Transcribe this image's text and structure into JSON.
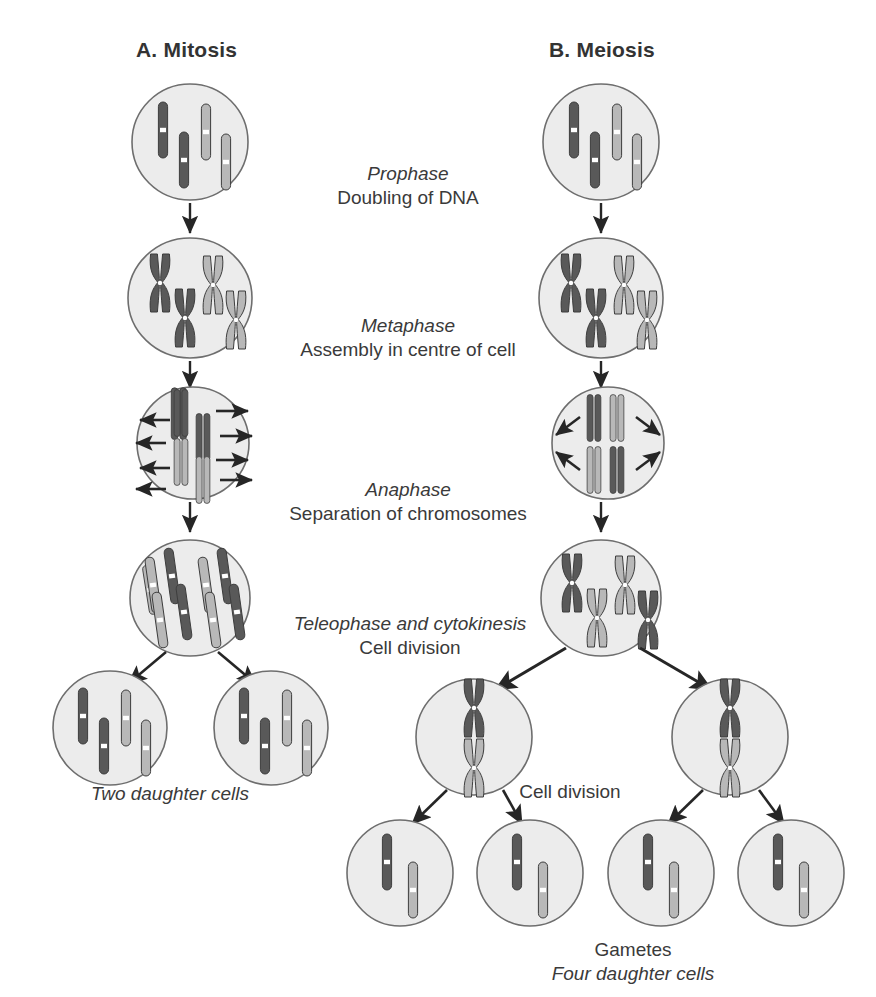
{
  "figure": {
    "columns": [
      {
        "id": "mitosis",
        "title": "A. Mitosis"
      },
      {
        "id": "meiosis",
        "title": "B. Meiosis"
      }
    ],
    "phases": [
      {
        "id": "prophase",
        "name": "Prophase",
        "description": "Doubling of DNA"
      },
      {
        "id": "metaphase",
        "name": "Metaphase",
        "description": "Assembly in centre of cell"
      },
      {
        "id": "anaphase",
        "name": "Anaphase",
        "description": "Separation of chromosomes"
      },
      {
        "id": "telophase",
        "name": "Teleophase and cytokinesis",
        "description": "Cell division"
      }
    ],
    "captions": [
      {
        "id": "two-daughter-cells",
        "italic": "Two daughter cells",
        "regular": ""
      },
      {
        "id": "cell-division-meiosis",
        "italic": "",
        "regular": "Cell division"
      },
      {
        "id": "gametes",
        "regular": "Gametes",
        "italic": "Four daughter cells"
      }
    ],
    "colors": {
      "chromosome_dark": "#595959",
      "chromosome_light": "#b3b3b3",
      "chromosome_outline": "#3d3d3d",
      "cell_fill": "#ececec",
      "cell_outline": "#6e6e6e",
      "arrow": "#262626",
      "text": "#333333",
      "background": "#ffffff"
    },
    "cells": [
      {
        "id": "mitosis-prophase",
        "column": "mitosis",
        "cx": 190,
        "cy": 142,
        "rx": 58,
        "ry": 58,
        "chromosomes": 4,
        "state": "single"
      },
      {
        "id": "mitosis-metaphase",
        "column": "mitosis",
        "cx": 190,
        "cy": 298,
        "rx": 62,
        "ry": 60,
        "chromosomes": 4,
        "state": "doubled"
      },
      {
        "id": "mitosis-anaphase",
        "column": "mitosis",
        "cx": 193,
        "cy": 443,
        "rx": 56,
        "ry": 56,
        "chromosomes": 4,
        "state": "aligned"
      },
      {
        "id": "mitosis-telophase",
        "column": "mitosis",
        "cx": 190,
        "cy": 598,
        "rx": 60,
        "ry": 58,
        "chromosomes": 8,
        "state": "separated"
      },
      {
        "id": "mitosis-daughter-1",
        "column": "mitosis",
        "cx": 110,
        "cy": 728,
        "rx": 57,
        "ry": 57,
        "chromosomes": 4,
        "state": "single"
      },
      {
        "id": "mitosis-daughter-2",
        "column": "mitosis",
        "cx": 271,
        "cy": 728,
        "rx": 57,
        "ry": 57,
        "chromosomes": 4,
        "state": "single"
      },
      {
        "id": "meiosis-prophase",
        "column": "meiosis",
        "cx": 601,
        "cy": 142,
        "rx": 58,
        "ry": 58,
        "chromosomes": 4,
        "state": "single"
      },
      {
        "id": "meiosis-metaphase",
        "column": "meiosis",
        "cx": 601,
        "cy": 298,
        "rx": 62,
        "ry": 60,
        "chromosomes": 4,
        "state": "doubled"
      },
      {
        "id": "meiosis-anaphase",
        "column": "meiosis",
        "cx": 608,
        "cy": 443,
        "rx": 56,
        "ry": 56,
        "chromosomes": 4,
        "state": "paired"
      },
      {
        "id": "meiosis-telophase",
        "column": "meiosis",
        "cx": 601,
        "cy": 598,
        "rx": 60,
        "ry": 58,
        "chromosomes": 4,
        "state": "doubled"
      },
      {
        "id": "meiosis-secondary-1",
        "column": "meiosis",
        "cx": 474,
        "cy": 737,
        "rx": 58,
        "ry": 58,
        "chromosomes": 2,
        "state": "doubled"
      },
      {
        "id": "meiosis-secondary-2",
        "column": "meiosis",
        "cx": 730,
        "cy": 737,
        "rx": 58,
        "ry": 58,
        "chromosomes": 2,
        "state": "doubled"
      },
      {
        "id": "gamete-1",
        "column": "meiosis",
        "cx": 400,
        "cy": 873,
        "rx": 53,
        "ry": 53,
        "chromosomes": 2,
        "state": "single"
      },
      {
        "id": "gamete-2",
        "column": "meiosis",
        "cx": 530,
        "cy": 873,
        "rx": 53,
        "ry": 53,
        "chromosomes": 2,
        "state": "single"
      },
      {
        "id": "gamete-3",
        "column": "meiosis",
        "cx": 661,
        "cy": 873,
        "rx": 53,
        "ry": 53,
        "chromosomes": 2,
        "state": "single"
      },
      {
        "id": "gamete-4",
        "column": "meiosis",
        "cx": 791,
        "cy": 873,
        "rx": 53,
        "ry": 53,
        "chromosomes": 2,
        "state": "single"
      }
    ]
  }
}
